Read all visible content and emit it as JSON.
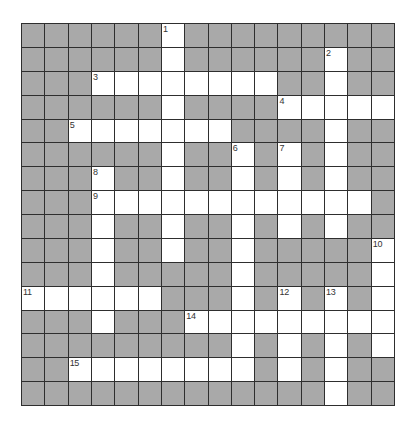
{
  "puzzle": {
    "type": "crossword",
    "rows": 16,
    "cols": 16,
    "colors": {
      "block": "#a9a9a9",
      "open": "#ffffff",
      "grid_line": "#2e2e2e",
      "number": "#333333"
    },
    "grid": [
      "######.#########",
      "######.######.##",
      "###........##.##",
      "######.####.....",
      "##.......####.##",
      "######.##.#.#.##",
      "###.##.##.#.#.##",
      "###............#",
      "###.##.##.#.#.##",
      "###.##.##.#####.",
      "###.#####.#####.",
      "......###.#.#.#.",
      "###.###.........",
      "#########.#.#.#.",
      "##........#.#.##",
      "#############.##"
    ],
    "numbers": [
      {
        "n": "1",
        "row": 0,
        "col": 6
      },
      {
        "n": "2",
        "row": 1,
        "col": 13
      },
      {
        "n": "3",
        "row": 2,
        "col": 3
      },
      {
        "n": "4",
        "row": 3,
        "col": 11
      },
      {
        "n": "5",
        "row": 4,
        "col": 2
      },
      {
        "n": "6",
        "row": 5,
        "col": 9
      },
      {
        "n": "7",
        "row": 5,
        "col": 11
      },
      {
        "n": "8",
        "row": 6,
        "col": 3
      },
      {
        "n": "9",
        "row": 7,
        "col": 3
      },
      {
        "n": "10",
        "row": 9,
        "col": 15
      },
      {
        "n": "11",
        "row": 11,
        "col": 0
      },
      {
        "n": "12",
        "row": 11,
        "col": 11
      },
      {
        "n": "13",
        "row": 11,
        "col": 13
      },
      {
        "n": "14",
        "row": 12,
        "col": 7
      },
      {
        "n": "15",
        "row": 14,
        "col": 2
      }
    ],
    "entries": {}
  }
}
